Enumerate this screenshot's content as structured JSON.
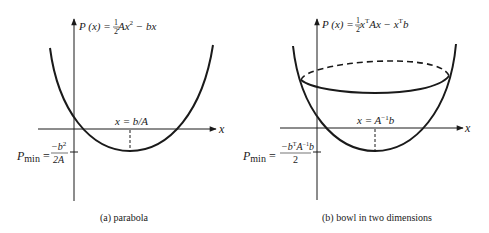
{
  "panels": [
    {
      "id": "a",
      "caption": "(a) parabola",
      "function_label": {
        "lhs": "P (x) = ",
        "frac_num": "1",
        "frac_den": "2",
        "rhs_a": " Ax",
        "rhs_exp": "2",
        "rhs_b": " − bx"
      },
      "axis_x_label": "x",
      "min_location_label": "x = b/A",
      "pmin": {
        "p": "P",
        "sub": "min",
        "eq": " = ",
        "num": "−b",
        "num_exp": "2",
        "den": "2A"
      }
    },
    {
      "id": "b",
      "caption": "(b) bowl in two dimensions",
      "function_label": {
        "lhs": "P (x) = ",
        "frac_num": "1",
        "frac_den": "2",
        "rhs_a": " x",
        "rhs_exp_a": "T",
        "rhs_b": "Ax − x",
        "rhs_exp_b": "T",
        "rhs_c": "b"
      },
      "axis_x_label": "x",
      "min_location_label": {
        "pre": "x = A",
        "exp": "−1",
        "post": "b"
      },
      "pmin": {
        "p": "P",
        "sub": "min",
        "eq": " = ",
        "num_pre": "−b",
        "num_exp1": "T",
        "num_mid": "A",
        "num_exp2": "−1",
        "num_post": "b",
        "den": "2"
      }
    }
  ],
  "colors": {
    "stroke": "#1a1a1a",
    "background": "#ffffff"
  }
}
